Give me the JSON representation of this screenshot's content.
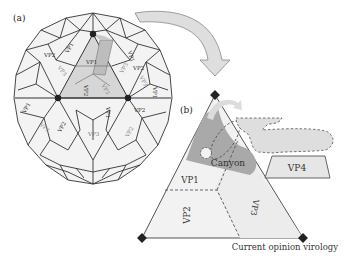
{
  "figure": {
    "panel_a_label": "(a)",
    "panel_b_label": "(b)",
    "caption": "Current opinion virology",
    "capsid_labels": [
      "VP1",
      "VP2",
      "VP3",
      "VP1",
      "VP2",
      "VP3",
      "VP1",
      "VP2",
      "VP3",
      "VP1",
      "VP2",
      "VP3",
      "VP1",
      "VP2",
      "VP3",
      "VP1",
      "VP2",
      "VP3"
    ],
    "triangle": {
      "regions": [
        "VP1",
        "VP2",
        "VP3"
      ],
      "canyon_label": "Canyon",
      "vp4_label": "VP4"
    },
    "colors": {
      "line": "#333333",
      "face": "#f2f2f2",
      "highlight": "#cfcfcf",
      "canyon": "#a8a8a8",
      "arrow": "#d9d9d9",
      "vertex": "#222222"
    }
  }
}
